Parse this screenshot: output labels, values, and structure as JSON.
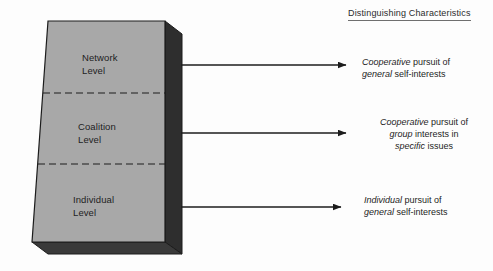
{
  "figure": {
    "column_header": "Distinguishing Characteristics"
  },
  "block": {
    "fill_color": "#a8a8a8",
    "side_color": "#2e2e2e",
    "bottom_color": "#3a3a3a",
    "outline_color": "#1c1c1c",
    "divider_style": "dashed",
    "levels": [
      {
        "id": "network",
        "label": "Network\nLevel"
      },
      {
        "id": "coalition",
        "label": "Coalition\nLevel"
      },
      {
        "id": "individual",
        "label": "Individual\nLevel"
      }
    ]
  },
  "arrows": {
    "count": 3,
    "direction": "right",
    "color": "#1c1c1c"
  },
  "characteristics": [
    {
      "id": "network",
      "lines": [
        [
          {
            "text": "Cooperative",
            "italic": true
          },
          {
            "text": " pursuit of",
            "italic": false
          }
        ],
        [
          {
            "text": "general",
            "italic": true
          },
          {
            "text": " self-interests",
            "italic": false
          }
        ]
      ]
    },
    {
      "id": "coalition",
      "lines": [
        [
          {
            "text": "Cooperative",
            "italic": true
          },
          {
            "text": " pursuit of",
            "italic": false
          }
        ],
        [
          {
            "text": "group",
            "italic": true
          },
          {
            "text": " interests in",
            "italic": false
          }
        ],
        [
          {
            "text": "specific",
            "italic": true
          },
          {
            "text": " issues",
            "italic": false
          }
        ]
      ]
    },
    {
      "id": "individual",
      "lines": [
        [
          {
            "text": "Individual",
            "italic": true
          },
          {
            "text": " pursuit of",
            "italic": false
          }
        ],
        [
          {
            "text": "general",
            "italic": true
          },
          {
            "text": " self-interests",
            "italic": false
          }
        ]
      ]
    }
  ]
}
